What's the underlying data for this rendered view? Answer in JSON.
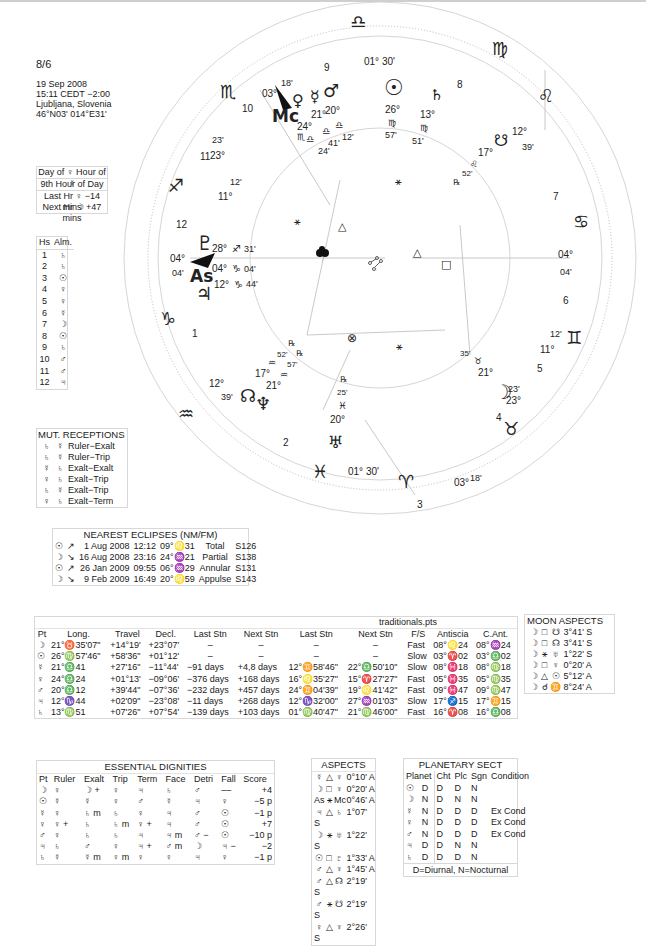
{
  "header": {
    "title": "8/6",
    "date": "19 Sep 2008",
    "time": "15:11  CEDT −2:00",
    "place": "Ljubljana, Slovenia",
    "coords": "46°N03' 014°E31'"
  },
  "hours": {
    "line1": "Day of ♀  Hour of ☿",
    "line2": "9th Hour of Day",
    "line3": "Last Hr ♀  −14 mins",
    "line4": "Next Hr ☽  +47 mins"
  },
  "almuten": {
    "headers": [
      "Hs",
      "Alm."
    ],
    "rows": [
      [
        "1",
        "♄"
      ],
      [
        "2",
        "♄"
      ],
      [
        "3",
        "☉"
      ],
      [
        "4",
        "♀"
      ],
      [
        "5",
        "♀"
      ],
      [
        "6",
        "☿"
      ],
      [
        "7",
        "☽"
      ],
      [
        "8",
        "☉"
      ],
      [
        "9",
        "♄"
      ],
      [
        "10",
        "♂"
      ],
      [
        "11",
        "♂"
      ],
      [
        "12",
        "♃"
      ]
    ]
  },
  "mutual_receptions": {
    "title": "MUT. RECEPTIONS",
    "rows": [
      [
        "♄",
        "☿",
        "Ruler−Exalt"
      ],
      [
        "♄",
        "☿",
        "Ruler−Trip"
      ],
      [
        "☿",
        "♄",
        "Exalt−Exalt"
      ],
      [
        "♀",
        "♄",
        "Exalt−Trip"
      ],
      [
        "♄",
        "☿",
        "Exalt−Trip"
      ],
      [
        "♀",
        "♄",
        "Exalt−Term"
      ]
    ]
  },
  "eclipses": {
    "title": "NEAREST ECLIPSES (NM/FM)",
    "rows": [
      [
        "☉",
        "↗",
        "1 Aug 2008",
        "12:12",
        "09°♌31",
        "Total",
        "S126"
      ],
      [
        "☽",
        "↘",
        "16 Aug 2008",
        "23:16",
        "24°♒21",
        "Partial",
        "S138"
      ],
      [
        "☉",
        "↗",
        "26 Jan 2009",
        "09:55",
        "06°♒29",
        "Annular",
        "S131"
      ],
      [
        "☽",
        "↘",
        "9 Feb 2009",
        "16:49",
        "20°♌59",
        "Appulse",
        "S143"
      ]
    ]
  },
  "traditionals": {
    "title": "traditionals.pts",
    "headers": [
      "Pt",
      "Long.",
      "Travel",
      "Decl.",
      "Last Stn",
      "Next Stn",
      "Last Stn",
      "Next Stn",
      "F/S",
      "Antiscia",
      "C.Ant."
    ],
    "rows": [
      [
        "☽",
        "21°♉35'07\"",
        "+14°19'",
        "+23°07'",
        "–",
        "–",
        "–",
        "–",
        "Fast",
        "08°♌24",
        "08°♒24"
      ],
      [
        "☉",
        "26°♍57'46\"",
        "+58'36\"",
        "+01°12'",
        "–",
        "–",
        "–",
        "–",
        "Slow",
        "03°♈02",
        "03°♎02"
      ],
      [
        "☿",
        "21°♎41",
        "+27'16\"",
        "−11°44'",
        "−91 days",
        "+4,8 days",
        "12°♊58'46\"",
        "22°♎50'10\"",
        "Slow",
        "08°♓18",
        "08°♍18"
      ],
      [
        "♀",
        "24°♎24",
        "+01°13'",
        "−09°06'",
        "−376 days",
        "+168 days",
        "16°♌35'27\"",
        "15°♈27'27\"",
        "Fast",
        "05°♓35",
        "05°♍35"
      ],
      [
        "♂",
        "20°♎12",
        "+39'44\"",
        "−07°36'",
        "−232 days",
        "+457 days",
        "24°♊04'39\"",
        "19°♌41'42\"",
        "Fast",
        "09°♓47",
        "09°♍47"
      ],
      [
        "♃",
        "12°♑44",
        "+02'09\"",
        "−23°08'",
        "−11 days",
        "+268 days",
        "12°♑32'00\"",
        "27°♒01'03\"",
        "Slow",
        "17°♐15",
        "17°♊15"
      ],
      [
        "♄",
        "13°♍51",
        "+07'26\"",
        "+07°54'",
        "−139 days",
        "+103 days",
        "01°♍40'47\"",
        "21°♍46'00\"",
        "Fast",
        "16°♈08",
        "16°♎08"
      ]
    ]
  },
  "moon_aspects": {
    "title": "MOON ASPECTS",
    "rows": [
      [
        "☽",
        "□",
        "☋",
        "3°41' S"
      ],
      [
        "☽",
        "□",
        "☊",
        "3°41' S"
      ],
      [
        "☽",
        "⚹",
        "♅",
        "1°22' S"
      ],
      [
        "☽",
        "□",
        "♆",
        "0°20' A"
      ],
      [
        "☽",
        "△",
        "☉",
        "5°12' A"
      ],
      [
        "☽",
        "☌",
        "♊",
        "8°24' A"
      ]
    ]
  },
  "dignities": {
    "title": "ESSENTIAL DIGNITIES",
    "headers": [
      "Pt",
      "Ruler",
      "Exalt",
      "Trip",
      "Term",
      "Face",
      "Detri",
      "Fall",
      "Score"
    ],
    "rows": [
      [
        "☽",
        "♀",
        "☽ +",
        "♀",
        "♃",
        "♄",
        "♂",
        "––",
        "+4"
      ],
      [
        "☉",
        "☿",
        "☿",
        "♀",
        "♂",
        "☿",
        "♃",
        "♀",
        "−5 p"
      ],
      [
        "☿",
        "♀",
        "♄ m",
        "♄",
        "♀",
        "♃",
        "♂",
        "☉",
        "−1 p"
      ],
      [
        "♀",
        "♀ +",
        "♄",
        "♄ m",
        "♀ +",
        "♃",
        "♂",
        "☉",
        "+7"
      ],
      [
        "♂",
        "♀",
        "♄",
        "♄",
        "♃",
        "♃ m",
        "♂ −",
        "☉",
        "−10 p"
      ],
      [
        "♃",
        "♄",
        "♂",
        "♀",
        "♃ +",
        "♂ m",
        "☽",
        "♃ −",
        "−2"
      ],
      [
        "♄",
        "☿",
        "☿ m",
        "♀ m",
        "♀",
        "♀",
        "♃",
        "♀",
        "−1 p"
      ]
    ]
  },
  "aspects": {
    "title": "ASPECTS",
    "rows": [
      [
        "☿",
        "△",
        "♆",
        "0°10' A"
      ],
      [
        "☽",
        "□",
        "♆",
        "0°20' A"
      ],
      [
        "As",
        "⚹",
        "Mc",
        "0°46' A"
      ],
      [
        "♃",
        "△",
        "♄",
        "1°07' S"
      ],
      [
        "☽",
        "⚹",
        "♅",
        "1°22' S"
      ],
      [
        "☉",
        "□",
        "♇",
        "1°33' A"
      ],
      [
        "♂",
        "△",
        "♆",
        "1°45' A"
      ],
      [
        "♂",
        "△",
        "☊",
        "2°19' S"
      ],
      [
        "♂",
        "⚹",
        "☋",
        "2°19' S"
      ],
      [
        "♀",
        "△",
        "♆",
        "2°26' S"
      ]
    ]
  },
  "sect": {
    "title": "PLANETARY SECT",
    "headers": [
      "Planet",
      "",
      "Cht",
      "Plc",
      "Sgn",
      "Condition"
    ],
    "rows": [
      [
        "☉",
        "D",
        "D",
        "D",
        "N",
        ""
      ],
      [
        "☽",
        "N",
        "D",
        "N",
        "N",
        ""
      ],
      [
        "☿",
        "N",
        "D",
        "D",
        "D",
        "Ex Cond"
      ],
      [
        "♀",
        "N",
        "D",
        "D",
        "D",
        "Ex Cond"
      ],
      [
        "♂",
        "N",
        "D",
        "D",
        "D",
        "Ex Cond"
      ],
      [
        "♃",
        "D",
        "D",
        "N",
        "N",
        ""
      ],
      [
        "♄",
        "D",
        "D",
        "D",
        "N",
        ""
      ]
    ],
    "footer": "D=Diurnal, N=Nocturnal"
  },
  "wheel": {
    "signs": {
      "libra": "♎",
      "virgo": "♍",
      "leo": "♌",
      "cancer": "♋",
      "gemini": "♊",
      "taurus": "♉",
      "aries": "♈",
      "pisces": "♓",
      "aquarius": "♒",
      "capricorn": "♑",
      "sagittarius": "♐",
      "scorpio": "♏"
    },
    "house_numbers": [
      "1",
      "2",
      "3",
      "4",
      "5",
      "6",
      "7",
      "8",
      "9",
      "10",
      "11",
      "12"
    ],
    "cusps": {
      "mc_deg": "03°",
      "mc_min": "18'",
      "ic_deg": "03°",
      "ic_min": "18'",
      "asc_deg": "04°",
      "asc_min": "04'",
      "dsc_deg": "04°",
      "dsc_min": "04'",
      "c9": "01° 30'",
      "c3": "01° 30'",
      "c11_deg": "23°",
      "c11_min": "23'",
      "c5_deg": "23°",
      "c5_min": "23'",
      "c12_deg": "11°",
      "c12_min": "12'",
      "c6_deg": "11°",
      "c6_min": "12'",
      "c2_deg": "12°",
      "c2_min": "39'",
      "c8_deg": "12°",
      "c8_min": "39'"
    },
    "planets": {
      "venus": {
        "glyph": "♀",
        "deg": "24°",
        "sign": "♎",
        "min": "24'"
      },
      "mercury": {
        "glyph": "☿",
        "deg": "21°",
        "sign": "♎",
        "min": "41'"
      },
      "mars": {
        "glyph": "♂",
        "deg": "20°",
        "sign": "♎",
        "min": "12'"
      },
      "sun": {
        "glyph": "☉",
        "deg": "26°",
        "sign": "♍",
        "min": "57'"
      },
      "saturn": {
        "glyph": "♄",
        "deg": "13°",
        "sign": "♍",
        "min": "51'"
      },
      "southnode": {
        "glyph": "☋",
        "deg": "17°",
        "sign": "♌",
        "min": "52'",
        "retro": "℞"
      },
      "pluto": {
        "glyph": "♇",
        "deg": "28°",
        "sign": "♐",
        "min": "31'"
      },
      "jupiter": {
        "glyph": "♃",
        "deg": "12°",
        "sign": "♑",
        "min": "44'"
      },
      "northnode": {
        "glyph": "☊",
        "deg": "17°",
        "sign": "♒",
        "min": "52'",
        "retro": "℞"
      },
      "neptune": {
        "glyph": "♆",
        "deg": "21°",
        "sign": "♒",
        "min": "57'",
        "retro": "℞"
      },
      "uranus": {
        "glyph": "♅",
        "deg": "20°",
        "sign": "♓",
        "min": "25'",
        "retro": "℞"
      },
      "moon": {
        "glyph": "☽",
        "deg": "21°",
        "sign": "♉",
        "min": "35'"
      },
      "fortune": {
        "glyph": "⊗"
      }
    },
    "labels": {
      "mc": "Mc",
      "as": "As",
      "asc_sign": "♑",
      "mc_sign": "♏"
    },
    "aspect_glyphs": {
      "sextile": "⚹",
      "trine": "△",
      "square": "□"
    }
  }
}
